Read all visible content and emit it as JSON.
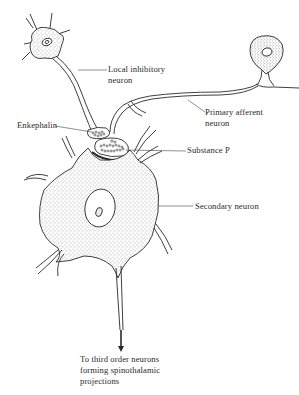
{
  "figure": {
    "type": "neuron-synapse-diagram",
    "ink_color": "#2a2a2a",
    "stipple_color": "#6a6a6a",
    "background": "#ffffff"
  },
  "labels": {
    "local_inhibitory_line1": "Local inhibitory",
    "local_inhibitory_line2": "neuron",
    "primary_afferent_line1": "Primary afferent",
    "primary_afferent_line2": "neuron",
    "enkephalin": "Enkephalin",
    "substance_p": "Substance P",
    "secondary_neuron": "Secondary neuron",
    "output_line1": "To third order neurons",
    "output_line2": "forming spinothalamic",
    "output_line3": "projections"
  },
  "structures": [
    {
      "name": "Local inhibitory neuron",
      "kind": "cell-body-with-axon"
    },
    {
      "name": "Primary afferent neuron",
      "kind": "pseudo-unipolar-cell-body-with-axon"
    },
    {
      "name": "Enkephalin",
      "kind": "presynaptic-terminal-vesicles"
    },
    {
      "name": "Substance P",
      "kind": "presynaptic-terminal-vesicles"
    },
    {
      "name": "Secondary neuron",
      "kind": "multipolar-cell-body"
    },
    {
      "name": "Output axon",
      "kind": "arrow-down"
    }
  ]
}
